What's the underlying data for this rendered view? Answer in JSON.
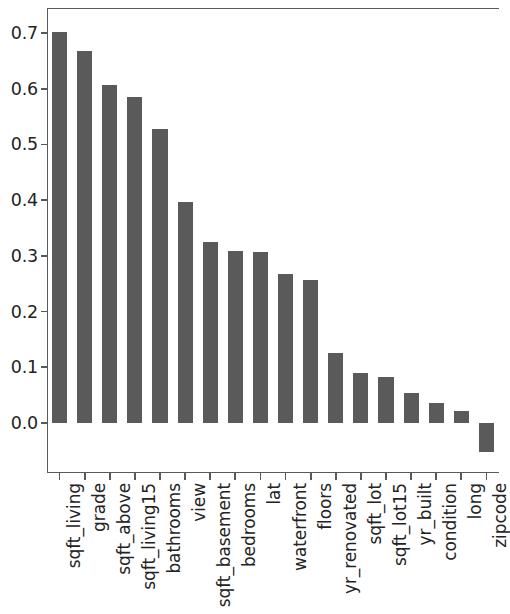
{
  "chart": {
    "type": "bar",
    "title": "",
    "xlabel": "",
    "ylabel": "",
    "background_color": "#ffffff",
    "bar_color": "#5a5a5a",
    "axis_color": "#555a5e",
    "grid": false,
    "legend": false
  },
  "chart_data": {
    "type": "bar",
    "title": "",
    "xlabel": "",
    "ylabel": "",
    "ylim": [
      -0.09,
      0.745
    ],
    "yticks": [
      0.0,
      0.1,
      0.2,
      0.3,
      0.4,
      0.5,
      0.6,
      0.7
    ],
    "ytick_labels": [
      "0.0",
      "0.1",
      "0.2",
      "0.3",
      "0.4",
      "0.5",
      "0.6",
      "0.7"
    ],
    "grid": false,
    "legend": false,
    "bar_color": "#5a5a5a",
    "categories": [
      "sqft_living",
      "grade",
      "sqft_above",
      "sqft_living15",
      "bathrooms",
      "view",
      "sqft_basement",
      "bedrooms",
      "lat",
      "waterfront",
      "floors",
      "yr_renovated",
      "sqft_lot",
      "sqft_lot15",
      "yr_built",
      "condition",
      "long",
      "zipcode"
    ],
    "values": [
      0.702,
      0.667,
      0.606,
      0.585,
      0.527,
      0.397,
      0.324,
      0.309,
      0.307,
      0.267,
      0.257,
      0.126,
      0.09,
      0.082,
      0.054,
      0.036,
      0.022,
      -0.053
    ]
  }
}
